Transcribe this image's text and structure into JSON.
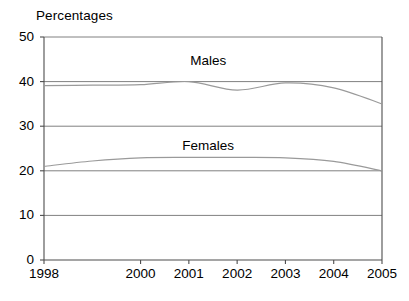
{
  "chart_data": {
    "type": "line",
    "title": "Percentages",
    "xlabel": "",
    "ylabel": "",
    "xlim": [
      1998,
      2005
    ],
    "ylim": [
      0,
      50
    ],
    "grid": true,
    "legend_position": "inline-annotations",
    "x_tick_labels": [
      "1998",
      "2000",
      "2001",
      "2002",
      "2003",
      "2004",
      "2005"
    ],
    "x_tick_values": [
      1998,
      2000,
      2001,
      2002,
      2003,
      2004,
      2005
    ],
    "y_tick_labels": [
      "0",
      "10",
      "20",
      "30",
      "40",
      "50"
    ],
    "y_tick_values": [
      0,
      10,
      20,
      30,
      40,
      50
    ],
    "x": [
      1998,
      1999,
      2000,
      2001,
      2002,
      2003,
      2004,
      2005
    ],
    "series": [
      {
        "name": "Males",
        "values": [
          39.1,
          39.2,
          39.3,
          40.0,
          38.1,
          39.7,
          38.6,
          35.0
        ]
      },
      {
        "name": "Females",
        "values": [
          21.0,
          22.2,
          22.9,
          23.0,
          23.0,
          22.9,
          22.1,
          20.0
        ]
      }
    ],
    "annotations": [
      {
        "text": "Males",
        "x": 2001.4,
        "y": 44.6
      },
      {
        "text": "Females",
        "x": 2001.4,
        "y": 25.6
      }
    ],
    "colors": {
      "axis": "#4d4d4d",
      "gridline": "#808080",
      "males_line": "#9a9a9a",
      "females_line": "#9a9a9a",
      "background": "#ffffff",
      "text": "#000000"
    }
  }
}
